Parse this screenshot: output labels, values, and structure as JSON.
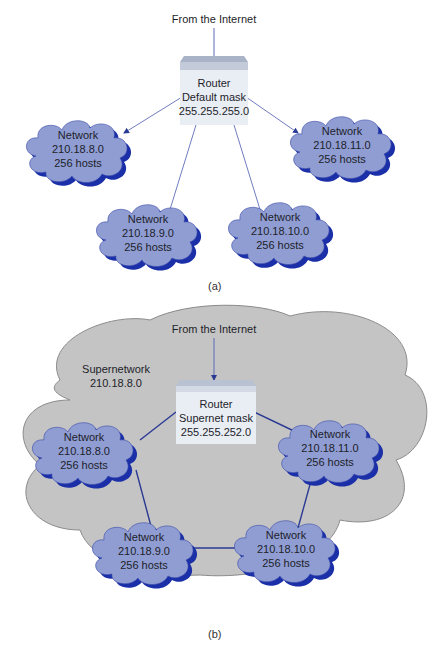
{
  "colors": {
    "cloud_fill": "#8f9dd3",
    "cloud_shadow": "#1a2fa8",
    "link_thin": "#5a6ab8",
    "link_thick": "#2b3a94",
    "router_top": "#a8b3c8",
    "router_face": "#e9edf4",
    "supernet_fill": "#c4c4c4",
    "supernet_stroke": "#7a7a7a"
  },
  "figure_a": {
    "internet_label": "From the Internet",
    "router": {
      "title": "Router",
      "mask_label": "Default mask",
      "mask": "255.255.255.0"
    },
    "networks": [
      {
        "title": "Network",
        "address": "210.18.8.0",
        "hosts": "256 hosts"
      },
      {
        "title": "Network",
        "address": "210.18.11.0",
        "hosts": "256 hosts"
      },
      {
        "title": "Network",
        "address": "210.18.9.0",
        "hosts": "256 hosts"
      },
      {
        "title": "Network",
        "address": "210.18.10.0",
        "hosts": "256 hosts"
      }
    ],
    "caption": "(a)"
  },
  "figure_b": {
    "internet_label": "From the Internet",
    "supernetwork": {
      "title": "Supernetwork",
      "address": "210.18.8.0"
    },
    "router": {
      "title": "Router",
      "mask_label": "Supernet mask",
      "mask": "255.255.252.0"
    },
    "networks": [
      {
        "title": "Network",
        "address": "210.18.8.0",
        "hosts": "256 hosts"
      },
      {
        "title": "Network",
        "address": "210.18.11.0",
        "hosts": "256 hosts"
      },
      {
        "title": "Network",
        "address": "210.18.9.0",
        "hosts": "256 hosts"
      },
      {
        "title": "Network",
        "address": "210.18.10.0",
        "hosts": "256 hosts"
      }
    ],
    "caption": "(b)"
  }
}
